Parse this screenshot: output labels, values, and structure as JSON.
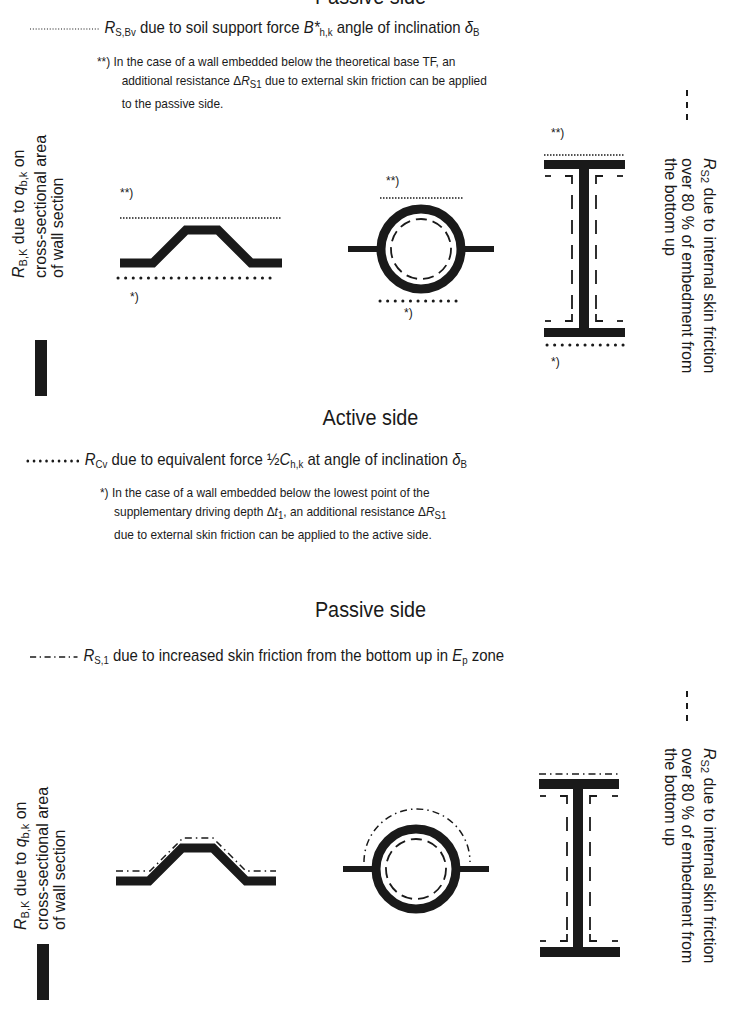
{
  "top_section": {
    "heading_partial": "Passive side",
    "legend": {
      "line_style": "dotted-fine",
      "symbol": "R",
      "symbol_sub": "S,Bv",
      "text_a": " due to soil support force ",
      "force_symbol": "B*",
      "force_sub": "h,k",
      "text_b": " angle of inclination ",
      "angle_symbol": "δ",
      "angle_sub": "B"
    },
    "note": {
      "marker": "**)",
      "line1": "In the case of a wall embedded below the theoretical base TF, an",
      "line2_a": "additional resistance Δ",
      "line2_sym": "R",
      "line2_sub": "S1",
      "line2_b": " due to external skin friction can be applied",
      "line3": "to the passive side."
    },
    "left_label": {
      "symbol": "R",
      "symbol_sub": "B,K",
      "line1_b": " due to ",
      "q_symbol": "q",
      "q_sub": "b,k",
      "line1_c": " on",
      "line2": "cross-sectional area",
      "line3": "of wall section"
    },
    "right_label": {
      "symbol": "R",
      "symbol_sub": "S2",
      "line1_b": " due to internal skin friction",
      "line2": "over 80 % of embedment from",
      "line3": "the bottom up"
    },
    "markers": {
      "double_star": "**)",
      "single_star": "*)"
    }
  },
  "active_section": {
    "heading": "Active side",
    "legend": {
      "line_style": "dotted-bold",
      "symbol": "R",
      "symbol_sub": "Cv",
      "text_a": " due to equivalent force ",
      "half": "½",
      "force_symbol": "C",
      "force_sub": "h,k",
      "text_b": " at angle of inclination ",
      "angle_symbol": "δ",
      "angle_sub": "B"
    },
    "note": {
      "marker": "*)",
      "line1": "In the case of a wall embedded below the lowest point of the",
      "line2_a": "supplementary driving depth Δ",
      "line2_sym": "t",
      "line2_sub": "1",
      "line2_b": ", an additional resistance Δ",
      "line2_sym2": "R",
      "line2_sub2": "S1",
      "line3": "due to external skin friction can be applied to the active side."
    }
  },
  "bottom_section": {
    "heading": "Passive side",
    "legend": {
      "line_style": "dash-dot",
      "symbol": "R",
      "symbol_sub": "S,1",
      "text_a": " due to increased skin friction from the bottom up in ",
      "zone_symbol": "E",
      "zone_sub": "p",
      "text_b": " zone"
    },
    "left_label": {
      "symbol": "R",
      "symbol_sub": "B,K",
      "line1_b": " due to ",
      "q_symbol": "q",
      "q_sub": "b,k",
      "line1_c": " on",
      "line2": "cross-sectional area",
      "line3": "of wall section"
    },
    "right_label": {
      "symbol": "R",
      "symbol_sub": "S2",
      "line1_b": " due to internal skin friction",
      "line2": "over 80 % of embedment from",
      "line3": "the bottom up"
    }
  },
  "wall_sections": [
    "trapezoidal-sheet-pile",
    "tube-pile",
    "h-beam"
  ],
  "colors": {
    "ink": "#1a1a1a",
    "background": "#ffffff"
  }
}
